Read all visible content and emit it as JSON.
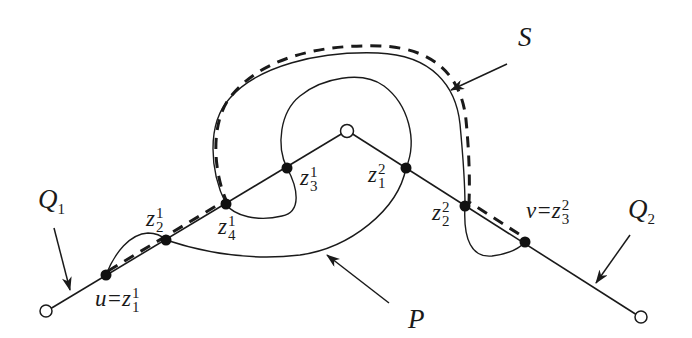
{
  "diagram": {
    "colors": {
      "stroke": "#1a1a1a",
      "background": "#ffffff"
    },
    "labels": {
      "Q1": {
        "base": "Q",
        "sub": "1"
      },
      "Q2": {
        "base": "Q",
        "sub": "2"
      },
      "S": "S",
      "P": "P",
      "u": {
        "prefix": "u=z",
        "sup": "1",
        "sub": "1"
      },
      "z21": {
        "base": "z",
        "sup": "1",
        "sub": "2"
      },
      "z41": {
        "base": "z",
        "sup": "1",
        "sub": "4"
      },
      "z31": {
        "base": "z",
        "sup": "1",
        "sub": "3"
      },
      "z12": {
        "base": "z",
        "sup": "2",
        "sub": "1"
      },
      "z22": {
        "base": "z",
        "sup": "2",
        "sub": "2"
      },
      "v": {
        "prefix": "v=z",
        "sup": "2",
        "sub": "3"
      }
    },
    "nodes": {
      "open": [
        {
          "id": "left-end",
          "x": 46,
          "y": 311
        },
        {
          "id": "apex",
          "x": 347,
          "y": 131
        },
        {
          "id": "right-end",
          "x": 641,
          "y": 317
        }
      ],
      "filled": [
        {
          "id": "u",
          "x": 106,
          "y": 275
        },
        {
          "id": "z21",
          "x": 166,
          "y": 240
        },
        {
          "id": "z41",
          "x": 226,
          "y": 204
        },
        {
          "id": "z31",
          "x": 287,
          "y": 168
        },
        {
          "id": "z12",
          "x": 406,
          "y": 168
        },
        {
          "id": "z22",
          "x": 465,
          "y": 206
        },
        {
          "id": "v",
          "x": 525,
          "y": 242
        }
      ]
    },
    "arrows": [
      {
        "target": "Q1",
        "from": [
          54,
          228
        ],
        "to": [
          70,
          290
        ]
      },
      {
        "target": "S",
        "from": [
          507,
          64
        ],
        "to": [
          451,
          90
        ]
      },
      {
        "target": "P",
        "from": [
          389,
          303
        ],
        "to": [
          327,
          255
        ]
      },
      {
        "target": "Q2",
        "from": [
          630,
          235
        ],
        "to": [
          596,
          283
        ]
      }
    ]
  }
}
